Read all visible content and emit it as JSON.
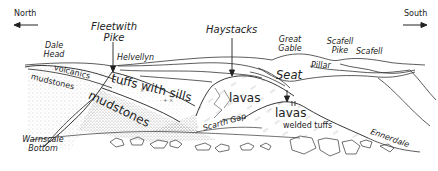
{
  "diagram": {
    "type": "geological cross-section sketch",
    "directions": {
      "left": "North",
      "right": "South"
    },
    "peaks": {
      "fleetwith_pike": "Fleetwith\nPike",
      "fleetwith_line1": "Fleetwith",
      "fleetwith_line2": "Pike",
      "haystacks": "Haystacks",
      "great_gable_line1": "Great",
      "great_gable_line2": "Gable",
      "scafell_pike_line1": "Scafell",
      "scafell_pike_line2": "Pike",
      "scafell": "Scafell",
      "helvellyn": "Helvellyn",
      "pillar": "Pillar",
      "dale_head_line1": "Dale",
      "dale_head_line2": "Head",
      "seat": "Seat"
    },
    "rocks": {
      "volcanics": "volcanics",
      "mudstones_upper": "mudstones",
      "tuffs_with_sills": "tuffs with sills",
      "mudstones_lower": "mudstones",
      "lavas_main": "lavas",
      "lavas_seat": "lavas",
      "welded_tuffs": "welded tuffs"
    },
    "places": {
      "scarth_gap": "Scarth Gap",
      "ennerdale": "Ennerdale",
      "warnscale_line1": "Warnscale",
      "warnscale_line2": "Bottom"
    },
    "colors": {
      "ink": "#222222",
      "stipple": "#9a9a9a",
      "background": "#ffffff"
    }
  }
}
